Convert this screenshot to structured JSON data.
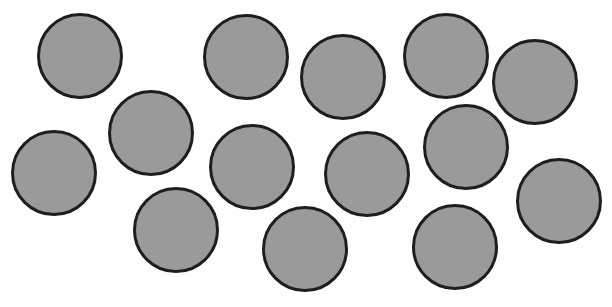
{
  "scene": {
    "width": 612,
    "height": 307,
    "background": "#ffffff",
    "fill_color": "#9a9a9a",
    "stroke_color": "#1e1e1e",
    "circle_count": 14,
    "circles": [
      {
        "cx": 80,
        "cy": 56,
        "r": 43
      },
      {
        "cx": 246,
        "cy": 57,
        "r": 43
      },
      {
        "cx": 343,
        "cy": 77,
        "r": 43
      },
      {
        "cx": 446,
        "cy": 56,
        "r": 43
      },
      {
        "cx": 535,
        "cy": 82,
        "r": 43
      },
      {
        "cx": 151,
        "cy": 133,
        "r": 43
      },
      {
        "cx": 54,
        "cy": 173,
        "r": 43
      },
      {
        "cx": 252,
        "cy": 167,
        "r": 43
      },
      {
        "cx": 367,
        "cy": 174,
        "r": 43
      },
      {
        "cx": 466,
        "cy": 147,
        "r": 43
      },
      {
        "cx": 559,
        "cy": 201,
        "r": 43
      },
      {
        "cx": 176,
        "cy": 230,
        "r": 43
      },
      {
        "cx": 305,
        "cy": 249,
        "r": 43
      },
      {
        "cx": 455,
        "cy": 247,
        "r": 43
      }
    ]
  }
}
